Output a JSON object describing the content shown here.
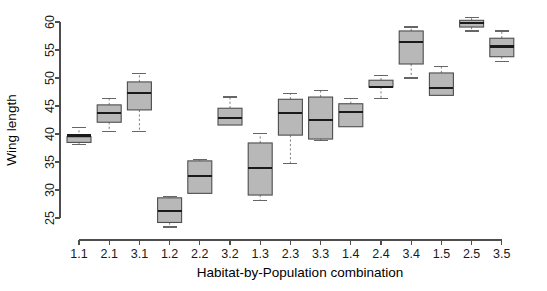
{
  "chart_data": {
    "type": "box",
    "title": "",
    "xlabel": "Habitat-by-Population combination",
    "ylabel": "Wing length",
    "ylim": [
      25,
      60
    ],
    "ytick_labels": [
      "25",
      "30",
      "35",
      "40",
      "45",
      "50",
      "55",
      "60"
    ],
    "ytick_values": [
      25,
      30,
      35,
      40,
      45,
      50,
      55,
      60
    ],
    "grid": false,
    "legend": false,
    "categories": [
      "1.1",
      "2.1",
      "3.1",
      "1.2",
      "2.2",
      "3.2",
      "1.3",
      "2.3",
      "3.3",
      "1.4",
      "2.4",
      "3.4",
      "1.5",
      "2.5",
      "3.5"
    ],
    "boxes": [
      {
        "label": "1.1",
        "whisker_low": 38.2,
        "q1": 38.5,
        "median": 39.7,
        "q3": 39.5,
        "whisker_high": 41.1
      },
      {
        "label": "2.1",
        "whisker_low": 40.5,
        "q1": 42.1,
        "median": 43.7,
        "q3": 45.2,
        "whisker_high": 46.4
      },
      {
        "label": "3.1",
        "whisker_low": 40.4,
        "q1": 44.3,
        "median": 47.3,
        "q3": 49.3,
        "whisker_high": 50.8
      },
      {
        "label": "1.2",
        "whisker_low": 23.4,
        "q1": 24.2,
        "median": 26.3,
        "q3": 28.6,
        "whisker_high": 28.9
      },
      {
        "label": "2.2",
        "whisker_low": 31.2,
        "q1": 29.4,
        "median": 32.5,
        "q3": 35.2,
        "whisker_high": 35.4
      },
      {
        "label": "3.2",
        "whisker_low": 41.6,
        "q1": 41.6,
        "median": 42.9,
        "q3": 44.6,
        "whisker_high": 46.6
      },
      {
        "label": "1.3",
        "whisker_low": 28.1,
        "q1": 29.1,
        "median": 33.9,
        "q3": 38.4,
        "whisker_high": 40.1
      },
      {
        "label": "2.3",
        "whisker_low": 34.8,
        "q1": 39.8,
        "median": 43.8,
        "q3": 46.2,
        "whisker_high": 47.3
      },
      {
        "label": "3.3",
        "whisker_low": 38.9,
        "q1": 39.1,
        "median": 42.5,
        "q3": 46.6,
        "whisker_high": 47.7
      },
      {
        "label": "1.4",
        "whisker_low": 41.6,
        "q1": 41.3,
        "median": 43.9,
        "q3": 45.4,
        "whisker_high": 46.4
      },
      {
        "label": "2.4",
        "whisker_low": 46.4,
        "q1": 48.4,
        "median": 48.4,
        "q3": 49.6,
        "whisker_high": 50.4
      },
      {
        "label": "3.4",
        "whisker_low": 50.0,
        "q1": 52.5,
        "median": 56.4,
        "q3": 58.4,
        "whisker_high": 59.1
      },
      {
        "label": "1.5",
        "whisker_low": 47.3,
        "q1": 46.9,
        "median": 48.2,
        "q3": 50.9,
        "whisker_high": 52.1
      },
      {
        "label": "2.5",
        "whisker_low": 58.4,
        "q1": 59.1,
        "median": 59.8,
        "q3": 60.3,
        "whisker_high": 60.8
      },
      {
        "label": "3.5",
        "whisker_low": 52.9,
        "q1": 53.8,
        "median": 55.6,
        "q3": 57.1,
        "whisker_high": 58.4
      }
    ]
  },
  "axes": {
    "y_title": "Wing length",
    "x_title": "Habitat-by-Population combination"
  }
}
